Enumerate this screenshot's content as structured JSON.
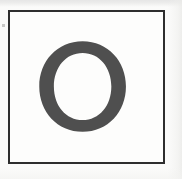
{
  "document": {
    "type": "scanned-letter-specimen",
    "page_background": "#fbfbfa",
    "paper_tone": "#fdfdfc"
  },
  "frame": {
    "name": "specimen-border",
    "border_color": "#2e2e2e",
    "border_width_px": 2,
    "x": 8,
    "y": 10,
    "width": 157,
    "height": 154
  },
  "glyph": {
    "character": "O",
    "label": "O",
    "description": "capital letter O, serif typeface",
    "fill_color": "#4f4f4f",
    "counter_color": "#fdfdfc",
    "bounds": {
      "x": 37,
      "y": 42,
      "width": 89,
      "height": 91
    }
  },
  "artifacts": {
    "dust_speck_color": "#c9c9c7",
    "scan_band_top_color": "#e6e6e6"
  }
}
